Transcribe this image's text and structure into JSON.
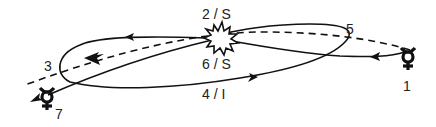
{
  "diagram": {
    "type": "orbital trajectory diagram",
    "center_symbol": "starburst (Sun / flyby point)",
    "labels": {
      "p1": "1",
      "p2": "2 / S",
      "p3": "3",
      "p4": "4 / I",
      "p5": "5",
      "p6": "6 / S",
      "p7": "7"
    },
    "symbols": {
      "start": "mercury-symbol",
      "end": "mercury-symbol",
      "center": "starburst-icon"
    },
    "line_styles": {
      "trajectory": "solid",
      "planet_orbit": "dashed"
    },
    "colors": {
      "ink": "#111111",
      "label": "#222222",
      "background": "#ffffff"
    }
  }
}
